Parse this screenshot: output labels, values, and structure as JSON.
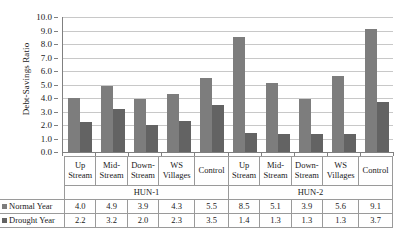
{
  "chart_data": {
    "type": "bar",
    "title": "",
    "xlabel": "",
    "ylabel": "Debt-Savings Ratio",
    "ylim": [
      0.0,
      10.0
    ],
    "ytick_step": 1.0,
    "ytick_labels": [
      "10.0",
      "9.0",
      "8.0",
      "7.0",
      "6.0",
      "5.0",
      "4.0",
      "3.0",
      "2.0",
      "1.0",
      "0.0"
    ],
    "grid": true,
    "legend_position": "table-row-headers",
    "categories": [
      "Up Stream",
      "Mid-Stream",
      "Down-Stream",
      "WS Villages",
      "Control",
      "Up Stream",
      "Mid-Stream",
      "Down-Stream",
      "WS Villages",
      "Control"
    ],
    "category_lines": [
      [
        "Up",
        "Stream"
      ],
      [
        "Mid-",
        "Stream"
      ],
      [
        "Down-",
        "Stream"
      ],
      [
        "WS",
        "Villages"
      ],
      [
        "Control"
      ],
      [
        "Up",
        "Stream"
      ],
      [
        "Mid-",
        "Stream"
      ],
      [
        "Down-",
        "Stream"
      ],
      [
        "WS",
        "Villages"
      ],
      [
        "Control"
      ]
    ],
    "groups": [
      {
        "label": "HUN-1",
        "span": 5
      },
      {
        "label": "HUN-2",
        "span": 5
      }
    ],
    "series": [
      {
        "name": "Normal Year",
        "color": "#7d7d7d",
        "values": [
          4.0,
          4.9,
          3.9,
          4.3,
          5.5,
          8.5,
          5.1,
          3.9,
          5.6,
          9.1
        ],
        "value_labels": [
          "4.0",
          "4.9",
          "3.9",
          "4.3",
          "5.5",
          "8.5",
          "5.1",
          "3.9",
          "5.6",
          "9.1"
        ]
      },
      {
        "name": "Drought Year",
        "color": "#636363",
        "values": [
          2.2,
          3.2,
          2.0,
          2.3,
          3.5,
          1.4,
          1.3,
          1.3,
          1.3,
          3.7
        ],
        "value_labels": [
          "2.2",
          "3.2",
          "2.0",
          "2.3",
          "3.5",
          "1.4",
          "1.3",
          "1.3",
          "1.3",
          "3.7"
        ]
      }
    ]
  }
}
